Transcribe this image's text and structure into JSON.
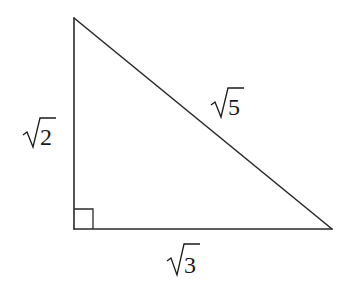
{
  "diagram": {
    "type": "right-triangle",
    "vertices": {
      "top": {
        "x": 74,
        "y": 18
      },
      "bottom_left": {
        "x": 74,
        "y": 229
      },
      "bottom_right": {
        "x": 332,
        "y": 229
      }
    },
    "right_angle_at": "bottom_left",
    "sides": [
      {
        "id": "left",
        "label": "2",
        "label_display": "√2"
      },
      {
        "id": "hypotenuse",
        "label": "5",
        "label_display": "√5"
      },
      {
        "id": "bottom",
        "label": "3",
        "label_display": "√3"
      }
    ],
    "colors": {
      "stroke": "#2a2a2a",
      "text": "#1a1a1a",
      "background": "#ffffff"
    }
  }
}
